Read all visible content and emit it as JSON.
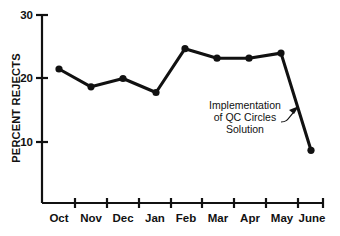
{
  "chart_data": {
    "type": "line",
    "title": "",
    "xlabel": "",
    "ylabel": "PERCENT REJECTS",
    "categories": [
      "Oct",
      "Nov",
      "Dec",
      "Jan",
      "Feb",
      "Mar",
      "Apr",
      "May",
      "June"
    ],
    "values": [
      21.5,
      18.7,
      20.0,
      17.8,
      24.7,
      23.2,
      23.2,
      24.0,
      8.7
    ],
    "ylim": [
      0,
      30
    ],
    "yticks": [
      10,
      20,
      30
    ],
    "ytick_labels": [
      "10",
      "20",
      "30"
    ],
    "grid": false,
    "legend": false,
    "marker": "filled-circle",
    "line_color": "#111111",
    "annotations": [
      {
        "name": "qc-circles-annotation",
        "lines": [
          "Implementation",
          "of QC Circles",
          "Solution"
        ],
        "points_to_category": "June",
        "arrow": true
      }
    ]
  },
  "axis": {
    "y_title": "PERCENT REJECTS"
  },
  "colors": {
    "ink": "#111111",
    "background": "#ffffff"
  }
}
